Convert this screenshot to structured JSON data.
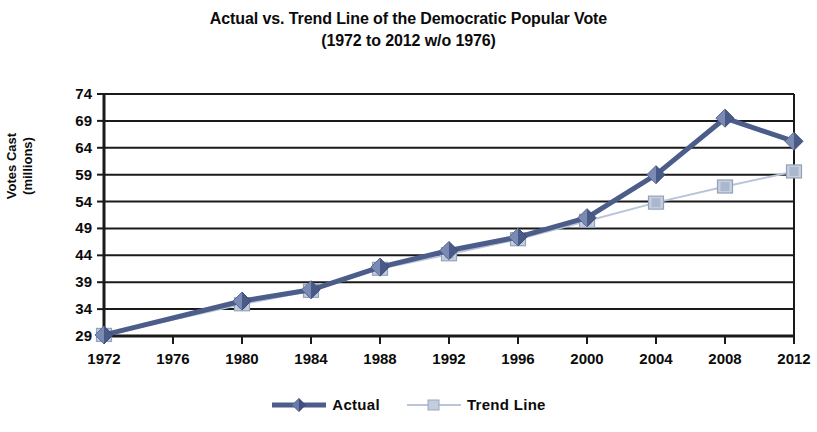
{
  "chart_data": {
    "type": "line",
    "title": "Actual vs. Trend Line of the Democratic Popular Vote",
    "subtitle": "(1972 to 2012 w/o 1976)",
    "xlabel": "",
    "ylabel_line1": "Votes Cast",
    "ylabel_line2": "(millions)",
    "categories": [
      "1972",
      "1976",
      "1980",
      "1984",
      "1988",
      "1992",
      "1996",
      "2000",
      "2004",
      "2008",
      "2012"
    ],
    "x_values": [
      1972,
      1976,
      1980,
      1984,
      1988,
      1992,
      1996,
      2000,
      2004,
      2008,
      2012
    ],
    "ytick_labels": [
      "29",
      "34",
      "39",
      "44",
      "49",
      "54",
      "59",
      "64",
      "69",
      "74"
    ],
    "ytick_values": [
      29,
      34,
      39,
      44,
      49,
      54,
      59,
      64,
      69,
      74
    ],
    "ylim": [
      29,
      74
    ],
    "grid": true,
    "legend_position": "bottom",
    "series": [
      {
        "name": "Actual",
        "color": "#4c5d8a",
        "marker": "diamond",
        "line_width": 5,
        "x": [
          1972,
          1980,
          1984,
          1988,
          1992,
          1996,
          2000,
          2004,
          2008,
          2012
        ],
        "values": [
          29.2,
          35.5,
          37.6,
          41.8,
          44.9,
          47.4,
          51.0,
          59.0,
          69.5,
          65.2
        ]
      },
      {
        "name": "Trend Line",
        "color": "#b9c5d9",
        "marker": "square",
        "line_width": 2,
        "x": [
          1972,
          1980,
          1984,
          1988,
          1992,
          1996,
          2000,
          2004,
          2008,
          2012
        ],
        "values": [
          29.2,
          34.9,
          37.4,
          41.5,
          44.2,
          47.0,
          50.4,
          53.8,
          56.8,
          59.6
        ]
      }
    ]
  },
  "legend": {
    "items": [
      {
        "label": "Actual"
      },
      {
        "label": "Trend Line"
      }
    ]
  },
  "colors": {
    "actual": "#4c5d8a",
    "trend": "#b9c5d9",
    "axis": "#1a1a1a",
    "grid": "#1a1a1a",
    "background": "#ffffff"
  }
}
